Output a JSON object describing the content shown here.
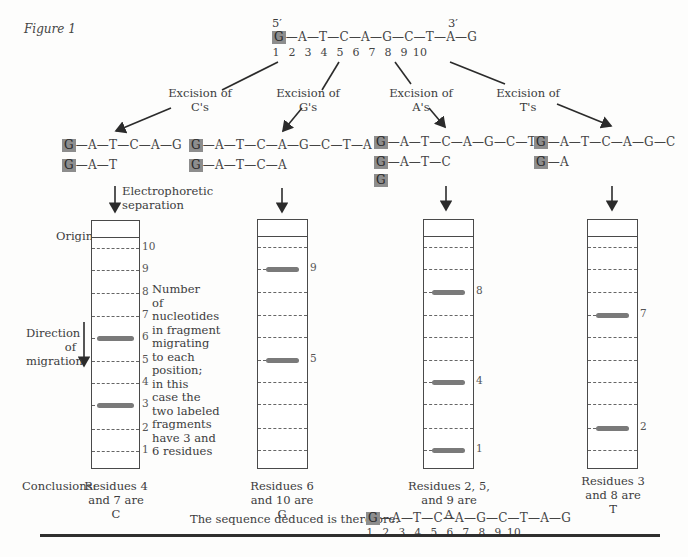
{
  "figure_label": "Figure 1",
  "original": {
    "five_prime": "5′",
    "three_prime": "3′",
    "sequence": [
      "G",
      "A",
      "T",
      "C",
      "A",
      "G",
      "C",
      "T",
      "A",
      "G"
    ],
    "positions": [
      "1",
      "2",
      "3",
      "4",
      "5",
      "6",
      "7",
      "8",
      "9",
      "10"
    ],
    "labeled_residue": "G"
  },
  "branches": [
    {
      "id": "C",
      "label_line1": "Excision of",
      "label_line2": "C's",
      "fragments": [
        "G—A—T—C—A—G",
        "G—A—T"
      ],
      "fragment_tails": [
        "—A—T—C—A—G",
        "—A—T"
      ],
      "bands": [
        "6",
        "3"
      ],
      "conclusion": [
        "Residues 4",
        "and 7 are",
        "C"
      ]
    },
    {
      "id": "G",
      "label_line1": "Excision of",
      "label_line2": "G's",
      "fragments": [
        "G—A—T—C—A—G—C—T—A",
        "G—A—T—C—A"
      ],
      "fragment_tails": [
        "—A—T—C—A—G—C—T—A",
        "—A—T—C—A"
      ],
      "bands": [
        "9",
        "5"
      ],
      "conclusion": [
        "Residues 6",
        "and 10 are",
        "G"
      ]
    },
    {
      "id": "A",
      "label_line1": "Excision of",
      "label_line2": "A's",
      "fragments": [
        "G—A—T—C—A—G—C—T",
        "G—A—T—C",
        "G"
      ],
      "fragment_tails": [
        "—A—T—C—A—G—C—T",
        "—A—T—C",
        ""
      ],
      "bands": [
        "8",
        "4",
        "1"
      ],
      "conclusion": [
        "Residues 2, 5,",
        "and 9 are",
        "A"
      ]
    },
    {
      "id": "T",
      "label_line1": "Excision of",
      "label_line2": "T's",
      "fragments": [
        "G—A—T—C—A—G—C",
        "G—A"
      ],
      "fragment_tails": [
        "—A—T—C—A—G—C",
        "—A"
      ],
      "bands": [
        "7",
        "2"
      ],
      "conclusion": [
        "Residues 3",
        "and 8 are",
        "T"
      ]
    }
  ],
  "gel_annotations": {
    "electrophoretic_line1": "Electrophoretic",
    "electrophoretic_line2": "separation",
    "origin": "Origin",
    "direction_line1": "Direction",
    "direction_line2": "of",
    "direction_line3": "migration",
    "scale_labels": [
      "10",
      "9",
      "8",
      "7",
      "6",
      "5",
      "4",
      "3",
      "2",
      "1"
    ],
    "note_lines": [
      "Number",
      "of",
      "nucleotides",
      "in fragment",
      "migrating",
      "to each",
      "position;",
      "in this",
      "case the",
      "two labeled",
      "fragments",
      "have 3 and",
      "6 residues"
    ]
  },
  "conclusions_label": "Conclusions:",
  "deduced": {
    "label": "The sequence deduced is therefore:",
    "sequence": [
      "G",
      "A",
      "T",
      "C",
      "A",
      "G",
      "C",
      "T",
      "A",
      "G"
    ],
    "positions": [
      "1",
      "2",
      "3",
      "4",
      "5",
      "6",
      "7",
      "8",
      "9",
      "10"
    ]
  },
  "chart_data": {
    "type": "diagram",
    "title": "Figure 1",
    "lanes": [
      {
        "lane": "C",
        "bands_at_length": [
          6,
          3
        ],
        "residues": [
          4,
          7
        ]
      },
      {
        "lane": "G",
        "bands_at_length": [
          9,
          5
        ],
        "residues": [
          6,
          10
        ]
      },
      {
        "lane": "A",
        "bands_at_length": [
          8,
          4,
          1
        ],
        "residues": [
          2,
          5,
          9
        ]
      },
      {
        "lane": "T",
        "bands_at_length": [
          7,
          2
        ],
        "residues": [
          3,
          8
        ]
      }
    ],
    "gel_positions": [
      10,
      9,
      8,
      7,
      6,
      5,
      4,
      3,
      2,
      1
    ],
    "deduced_sequence": "GATCAGCTAG"
  },
  "colors": {
    "label_box": "#8d8d8d",
    "ink": "#3c3c3c",
    "band": "#7a7a7a"
  }
}
